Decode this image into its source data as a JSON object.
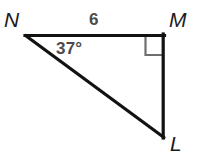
{
  "figure": {
    "kind": "geometry-diagram",
    "shape_name": "right-triangle",
    "background_color": "#ffffff",
    "stroke_color": "#121212",
    "marker_color": "#6e6e6e",
    "label_color": "#1b1b1b",
    "measure_color": "#4b4b4b",
    "width": 201,
    "height": 161
  },
  "vertices": [
    {
      "id": "N",
      "label": "N",
      "x": 26,
      "y": 35,
      "label_x": 4,
      "label_y": 9
    },
    {
      "id": "M",
      "label": "M",
      "x": 164,
      "y": 35,
      "label_x": 169,
      "label_y": 9
    },
    {
      "id": "L",
      "label": "L",
      "x": 164,
      "y": 137,
      "label_x": 170,
      "label_y": 133
    }
  ],
  "sides": [
    {
      "id": "NM",
      "from": "N",
      "to": "M",
      "length_label": "6",
      "label_x": 89,
      "label_y": 11
    },
    {
      "id": "ML",
      "from": "M",
      "to": "L",
      "length_label": ""
    },
    {
      "id": "LN",
      "from": "L",
      "to": "N",
      "length_label": ""
    }
  ],
  "angles": [
    {
      "at": "N",
      "label": "37°",
      "value": 37,
      "unit": "degrees",
      "label_x": 56,
      "label_y": 40
    },
    {
      "at": "M",
      "label": "",
      "value": 90,
      "unit": "degrees",
      "marker": "right-angle-square"
    }
  ],
  "markers": {
    "right_angle_square": {
      "vertex": "M",
      "size": 19,
      "x": 145,
      "y": 36
    }
  },
  "accessibility": {
    "description": "Right triangle N M L with right angle at M, side N M labeled 6, and angle at N labeled 37 degrees."
  }
}
